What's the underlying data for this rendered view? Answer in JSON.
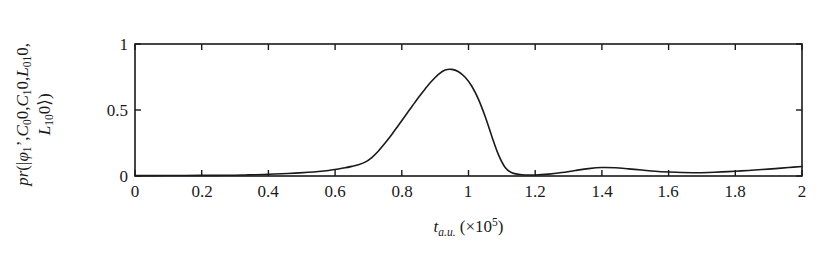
{
  "chart_data": {
    "type": "line",
    "title": "",
    "subtitle": "",
    "xlabel_text": "t_{a.u.} (×10^5)",
    "xlabel_parts": {
      "symbol": "t",
      "subscript": "a.u.",
      "paren_open": "(",
      "multiplier": "×10",
      "exponent": "5",
      "paren_close": ")"
    },
    "ylabel_text": "pr(|φ₁', C₀0, C₁0, L₀₁0, L₁₀0⟩)",
    "ylabel_line1": "pr(|φ₁’, C₀0, C₁0, L₀₁0,",
    "ylabel_line2": "L₁₀0⟩)",
    "xlim": [
      0,
      2
    ],
    "ylim": [
      0,
      1
    ],
    "xticks": [
      0,
      0.2,
      0.4,
      0.6,
      0.8,
      1,
      1.2,
      1.4,
      1.6,
      1.8,
      2
    ],
    "xtick_labels": [
      "0",
      "0.2",
      "0.4",
      "0.6",
      "0.8",
      "1",
      "1.2",
      "1.4",
      "1.6",
      "1.8",
      "2"
    ],
    "yticks": [
      0,
      0.5,
      1
    ],
    "ytick_labels": [
      "0",
      "0.5",
      "1"
    ],
    "grid": false,
    "legend": false,
    "line_color": "#1a1a1a",
    "line_width": 1.6,
    "frame_color": "#1a1a1a",
    "background": "#ffffff",
    "peak_value": 0.81,
    "peak_x": 0.93,
    "secondary_bump_value": 0.065,
    "secondary_bump_x": 1.4,
    "series": [
      {
        "name": "pr",
        "x": [
          0.0,
          0.05,
          0.1,
          0.15,
          0.2,
          0.25,
          0.3,
          0.33,
          0.36,
          0.4,
          0.44,
          0.48,
          0.52,
          0.55,
          0.58,
          0.61,
          0.63,
          0.65,
          0.67,
          0.69,
          0.71,
          0.73,
          0.75,
          0.77,
          0.79,
          0.81,
          0.83,
          0.85,
          0.87,
          0.89,
          0.91,
          0.93,
          0.95,
          0.97,
          0.99,
          1.01,
          1.03,
          1.05,
          1.07,
          1.09,
          1.11,
          1.13,
          1.16,
          1.2,
          1.24,
          1.28,
          1.32,
          1.36,
          1.4,
          1.44,
          1.48,
          1.52,
          1.56,
          1.6,
          1.64,
          1.68,
          1.72,
          1.76,
          1.8,
          1.84,
          1.88,
          1.92,
          1.96,
          2.0
        ],
        "y": [
          0.003,
          0.003,
          0.004,
          0.004,
          0.005,
          0.005,
          0.006,
          0.008,
          0.01,
          0.013,
          0.017,
          0.022,
          0.028,
          0.034,
          0.042,
          0.053,
          0.062,
          0.073,
          0.085,
          0.105,
          0.14,
          0.19,
          0.25,
          0.315,
          0.385,
          0.455,
          0.525,
          0.595,
          0.66,
          0.72,
          0.77,
          0.803,
          0.808,
          0.79,
          0.748,
          0.68,
          0.58,
          0.45,
          0.3,
          0.16,
          0.065,
          0.025,
          0.01,
          0.008,
          0.014,
          0.026,
          0.042,
          0.056,
          0.064,
          0.062,
          0.054,
          0.045,
          0.036,
          0.03,
          0.026,
          0.025,
          0.027,
          0.031,
          0.036,
          0.042,
          0.049,
          0.056,
          0.064,
          0.072
        ]
      }
    ]
  },
  "axes": {
    "ylabel_display": "pr(|φ₁’,C₀0,C₁0,L₀₁0,L₁₀0⟩)"
  }
}
